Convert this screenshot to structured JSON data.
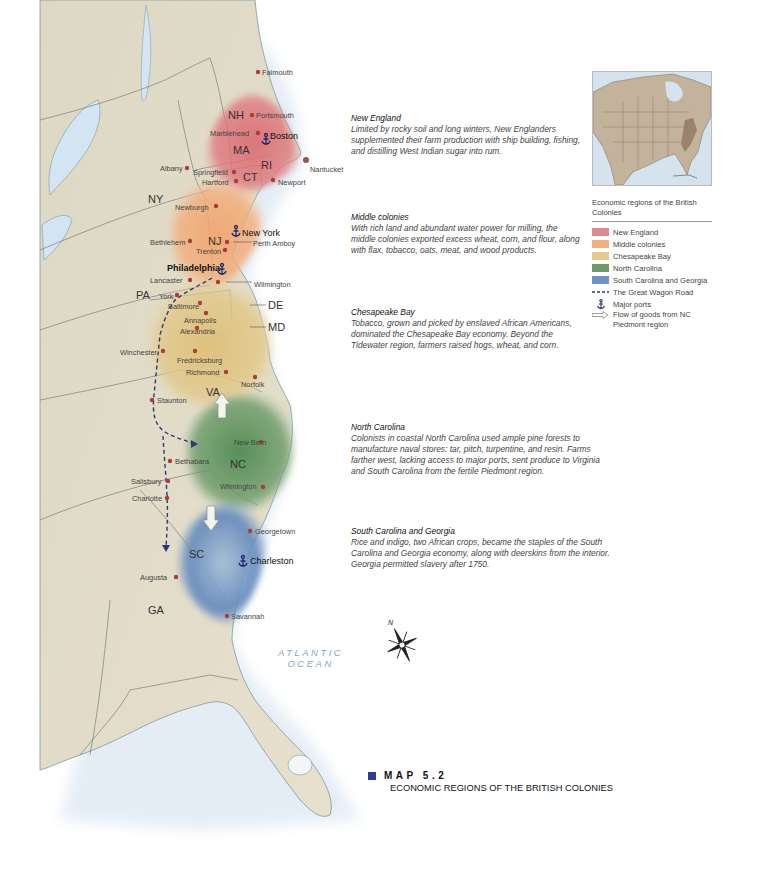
{
  "map": {
    "number_label": "MAP 5.2",
    "title": "ECONOMIC REGIONS OF THE BRITISH COLONIES",
    "accent_color": "#2b3c9e",
    "ocean_label_1": "ATLANTIC",
    "ocean_label_2": "OCEAN",
    "compass": {
      "north_label": "N"
    }
  },
  "states": [
    "NH",
    "MA",
    "RI",
    "CT",
    "NY",
    "NJ",
    "PA",
    "DE",
    "MD",
    "VA",
    "NC",
    "SC",
    "GA"
  ],
  "cities": {
    "falmouth": "Falmouth",
    "portsmouth": "Portsmouth",
    "marblehead": "Marblehead",
    "boston": "Boston",
    "albany": "Albany",
    "springfield": "Springfield",
    "hartford": "Hartford",
    "newport": "Newport",
    "nantucket": "Nantucket",
    "newburgh": "Newburgh",
    "new_york": "New York",
    "perth_amboy": "Perth Amboy",
    "bethlehem": "Bethlehem",
    "trenton": "Trenton",
    "philadelphia": "Philadelphia",
    "lancaster": "Lancaster",
    "wilmington_de": "Wilmington",
    "york": "York",
    "baltimore": "Baltimore",
    "annapolis": "Annapolis",
    "alexandria": "Alexandria",
    "winchester": "Winchester",
    "fredricksburg": "Fredricksburg",
    "richmond": "Richmond",
    "norfolk": "Norfolk",
    "staunton": "Staunton",
    "new_bern": "New Bern",
    "bethabara": "Bethabara",
    "salisbury": "Salisbury",
    "charlotte": "Charlotte",
    "wilmington_nc": "Wilmington",
    "georgetown": "Georgetown",
    "charleston": "Charleston",
    "augusta": "Augusta",
    "savannah": "Savannah"
  },
  "regions": [
    {
      "name": "New England",
      "color": "#e08a8f",
      "description": "Limited by rocky soil and long winters, New Englanders supplemented their farm production with ship building, fishing, and distilling West Indian sugar into rum."
    },
    {
      "name": "Middle colonies",
      "color": "#f2b07e",
      "description": "With rich land and abundant water power for milling, the  middle colonies exported excess wheat, corn, and flour, along with flax, tobacco, oats, meat, and wood products."
    },
    {
      "name": "Chesapeake Bay",
      "color": "#e2c98c",
      "description": "Tobacco, grown and picked by enslaved African Americans, dominated the Chesapeake Bay economy. Beyond the Tidewater region, farmers raised hogs, wheat, and corn."
    },
    {
      "name": "North Carolina",
      "color": "#6e9a6a",
      "description": "Colonists in coastal North Carolina used ample pine forests to manufacture naval stores: tar, pitch, turpentine, and resin. Farms farther west, lacking access to major ports, sent produce to Virginia and South Carolina from the fertile Piedmont region."
    },
    {
      "name": "South Carolina and Georgia",
      "color": "#6f93c2",
      "description": "Rice and indigo, two African crops, became the staples of the South Carolina and Georgia economy, along with deerskins from the interior. Georgia permitted slavery after 1750."
    }
  ],
  "legend": {
    "title": "Economic regions of the British Colonies",
    "items": [
      {
        "label": "New England",
        "color": "#e08a8f"
      },
      {
        "label": "Middle colonies",
        "color": "#f2b07e"
      },
      {
        "label": "Chesapeake Bay",
        "color": "#e2c98c"
      },
      {
        "label": "North Carolina",
        "color": "#6e9a6a"
      },
      {
        "label": "South Carolina and Georgia",
        "color": "#6f93c2"
      }
    ],
    "wagon_road": "The Great Wagon Road",
    "major_ports": "Major ports",
    "flow_of_goods": "Flow of goods from NC Piedmont region"
  }
}
